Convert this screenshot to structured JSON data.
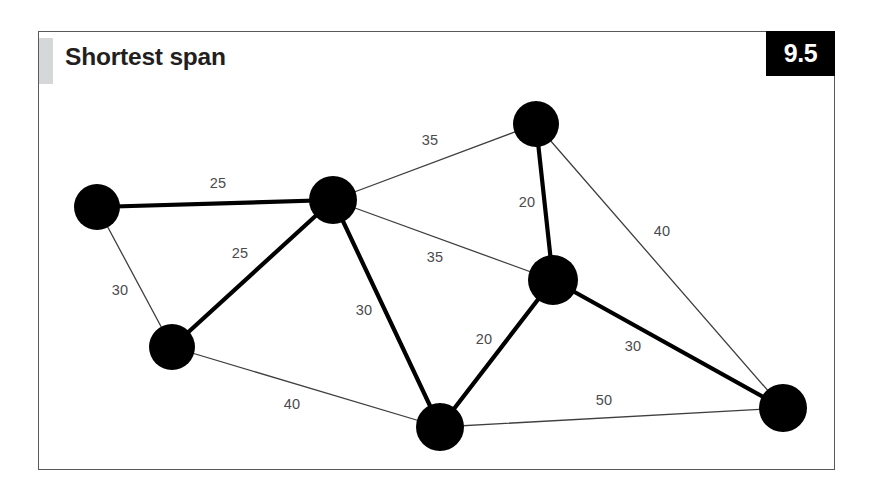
{
  "page": {
    "background": "#ffffff"
  },
  "card": {
    "title": "Shortest span",
    "badge": "9.5",
    "badge_bg": "#000000",
    "badge_fg": "#ffffff",
    "border_color": "#58595b",
    "accent_color": "#d6d7d9",
    "background": "#ffffff"
  },
  "chart_data": {
    "type": "diagram",
    "subtype": "weighted-graph-minimum-spanning-tree",
    "title": "Shortest span",
    "node_color": "#000000",
    "tree_edge_color": "#000000",
    "other_edge_color": "#3f3f41",
    "label_color": "#4b4b4d",
    "nodes": [
      {
        "id": "A",
        "x": 97,
        "y": 207,
        "r": 23
      },
      {
        "id": "B",
        "x": 333,
        "y": 200,
        "r": 24
      },
      {
        "id": "C",
        "x": 536,
        "y": 124,
        "r": 23
      },
      {
        "id": "D",
        "x": 553,
        "y": 280,
        "r": 25
      },
      {
        "id": "E",
        "x": 172,
        "y": 347,
        "r": 23
      },
      {
        "id": "F",
        "x": 440,
        "y": 427,
        "r": 24
      },
      {
        "id": "G",
        "x": 783,
        "y": 408,
        "r": 24
      }
    ],
    "edges": [
      {
        "from": "A",
        "to": "B",
        "weight": 25,
        "in_tree": true,
        "label_x": 218,
        "label_y": 183
      },
      {
        "from": "A",
        "to": "E",
        "weight": 30,
        "in_tree": false,
        "label_x": 120,
        "label_y": 290
      },
      {
        "from": "B",
        "to": "E",
        "weight": 25,
        "in_tree": true,
        "label_x": 240,
        "label_y": 253
      },
      {
        "from": "B",
        "to": "C",
        "weight": 35,
        "in_tree": false,
        "label_x": 430,
        "label_y": 140
      },
      {
        "from": "B",
        "to": "D",
        "weight": 35,
        "in_tree": false,
        "label_x": 435,
        "label_y": 257
      },
      {
        "from": "B",
        "to": "F",
        "weight": 30,
        "in_tree": true,
        "label_x": 364,
        "label_y": 310
      },
      {
        "from": "C",
        "to": "D",
        "weight": 20,
        "in_tree": true,
        "label_x": 527,
        "label_y": 202
      },
      {
        "from": "C",
        "to": "G",
        "weight": 40,
        "in_tree": false,
        "label_x": 662,
        "label_y": 231
      },
      {
        "from": "D",
        "to": "F",
        "weight": 20,
        "in_tree": true,
        "label_x": 484,
        "label_y": 339
      },
      {
        "from": "D",
        "to": "G",
        "weight": 30,
        "in_tree": true,
        "label_x": 633,
        "label_y": 346
      },
      {
        "from": "E",
        "to": "F",
        "weight": 40,
        "in_tree": false,
        "label_x": 292,
        "label_y": 404
      },
      {
        "from": "F",
        "to": "G",
        "weight": 50,
        "in_tree": false,
        "label_x": 604,
        "label_y": 400
      }
    ],
    "tree_total_weight": 150,
    "xlim": [
      0,
      874
    ],
    "ylim": [
      0,
      500
    ],
    "grid": false,
    "legend": null
  }
}
